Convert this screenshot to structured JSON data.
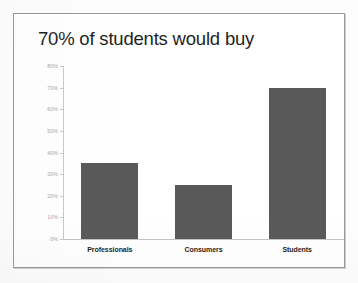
{
  "slide": {
    "title": "70% of students would buy",
    "background_color": "#ffffff",
    "border_color": "#9a9a9a"
  },
  "chart_data": {
    "type": "bar",
    "title": "70% of students would buy",
    "categories": [
      "Professionals",
      "Consumers",
      "Students"
    ],
    "values": [
      35,
      25,
      70
    ],
    "series": [
      {
        "name": "Would buy",
        "values": [
          35,
          25,
          70
        ]
      }
    ],
    "xlabel": "",
    "ylabel": "",
    "ylim": [
      0,
      80
    ],
    "ytick_values": [
      0,
      10,
      20,
      30,
      40,
      50,
      60,
      70,
      80
    ],
    "ytick_labels": [
      "0%",
      "10%",
      "20%",
      "30%",
      "40%",
      "50%",
      "60%",
      "70%",
      "80%"
    ],
    "value_format": "percent",
    "grid": false,
    "legend": false,
    "legend_position": "none",
    "bar_color": "#595959",
    "axis_color": "#c9c9c9",
    "tick_label_color": "#a6a6a6",
    "category_label_color": "#1e1e1e"
  }
}
